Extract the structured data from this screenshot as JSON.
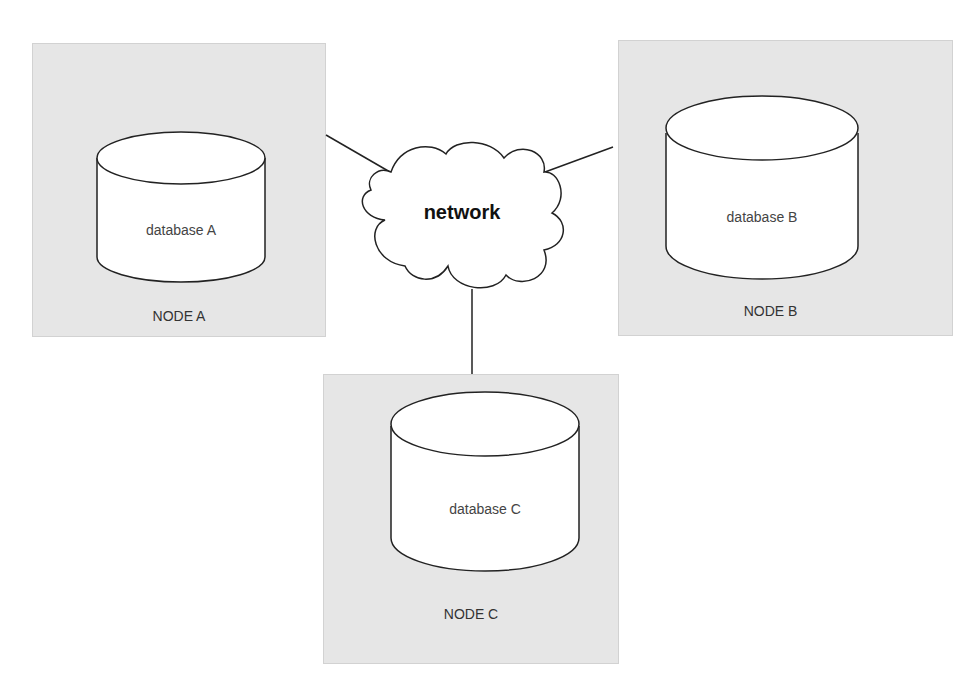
{
  "diagram": {
    "network": {
      "label": "network"
    },
    "nodes": [
      {
        "id": "A",
        "label": "NODE A",
        "database": "database A"
      },
      {
        "id": "B",
        "label": "NODE B",
        "database": "database B"
      },
      {
        "id": "C",
        "label": "NODE C",
        "database": "database C"
      }
    ],
    "connections": [
      {
        "from": "NODE A",
        "to": "network"
      },
      {
        "from": "NODE B",
        "to": "network"
      },
      {
        "from": "NODE C",
        "to": "network"
      }
    ],
    "colors": {
      "node_fill": "#e6e6e6",
      "node_border": "#d2d2d2",
      "shape_fill": "#ffffff",
      "stroke": "#222222"
    }
  }
}
